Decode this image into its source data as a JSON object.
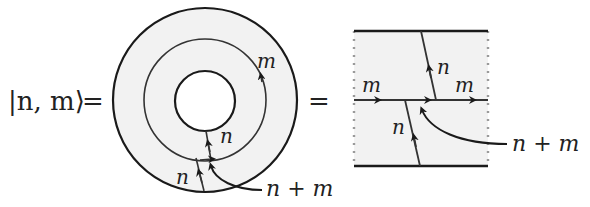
{
  "equation": {
    "lhs": "|n, m⟩",
    "equals_1": "=",
    "equals_2": "="
  },
  "annulus_diagram": {
    "labels": {
      "outer_loop": "m",
      "inner_strand": "n",
      "lower_strand": "n",
      "pointer_label": "n + m"
    }
  },
  "square_diagram": {
    "labels": {
      "left_horizontal": "m",
      "right_horizontal": "m",
      "upper_vertical": "n",
      "lower_vertical": "n",
      "pointer_label": "n + m"
    }
  },
  "colors": {
    "stroke": "#1a1a1a",
    "shading": "#f2f2f2",
    "dotted_edge": "#9a9a9a"
  }
}
